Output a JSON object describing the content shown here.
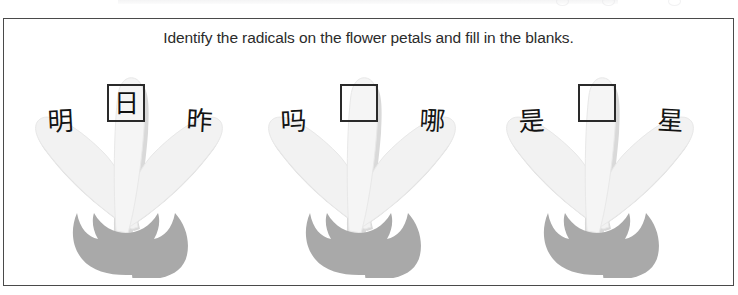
{
  "worksheet": {
    "instruction": "Identify the radicals on the flower petals and fill in the blanks.",
    "border_color": "#4a4a4a",
    "background": "#ffffff"
  },
  "colors": {
    "petal_fill": "#f2f2f2",
    "petal_shadow": "#d9d9d9",
    "petal_edge": "#e3e3e3",
    "calyx_fill": "#a9a9a9",
    "text": "#141414",
    "box_border": "#2a2a2a"
  },
  "flowers": [
    {
      "id": "flower-1",
      "left_petal_char": "明",
      "center_box_char": "日",
      "center_box_filled": true,
      "right_petal_char": "昨"
    },
    {
      "id": "flower-2",
      "left_petal_char": "吗",
      "center_box_char": "",
      "center_box_filled": false,
      "right_petal_char": "哪"
    },
    {
      "id": "flower-3",
      "left_petal_char": "是",
      "center_box_char": "",
      "center_box_filled": false,
      "right_petal_char": "星"
    }
  ]
}
